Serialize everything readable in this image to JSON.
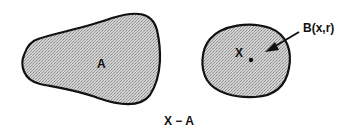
{
  "figure": {
    "caption": "X − A",
    "regions": [
      {
        "id": "A",
        "label": "A",
        "description": "irregular pear-shaped region"
      },
      {
        "id": "X",
        "label": "X",
        "description": "rounded region containing a point"
      }
    ],
    "ball": {
      "label": "B(x,r)",
      "description": "arrow points to a small neighborhood around a point in X"
    },
    "fill_color": "#c8c8c8",
    "stroke_color": "#111111"
  }
}
